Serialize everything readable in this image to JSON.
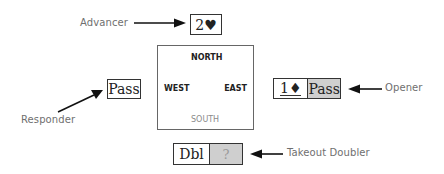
{
  "diagram": {
    "type": "bridge-bidding-table",
    "seats": {
      "north": "NORTH",
      "west": "WEST",
      "east": "EAST",
      "south": "SOUTH"
    },
    "roles": {
      "advancer": "Advancer",
      "responder": "Responder",
      "opener": "Opener",
      "takeout_doubler": "Takeout Doubler"
    },
    "bids": {
      "north": {
        "call": "2♥"
      },
      "west": {
        "call": "Pass"
      },
      "east": {
        "first_call": "1♦",
        "second_call": "Pass"
      },
      "south": {
        "first_call": "Dbl",
        "second_call": "?"
      }
    },
    "colors": {
      "box_border": "#333333",
      "highlight_fill": "#cfcfcf",
      "label_text": "#6f6f6f",
      "arrow": "#111111"
    }
  }
}
